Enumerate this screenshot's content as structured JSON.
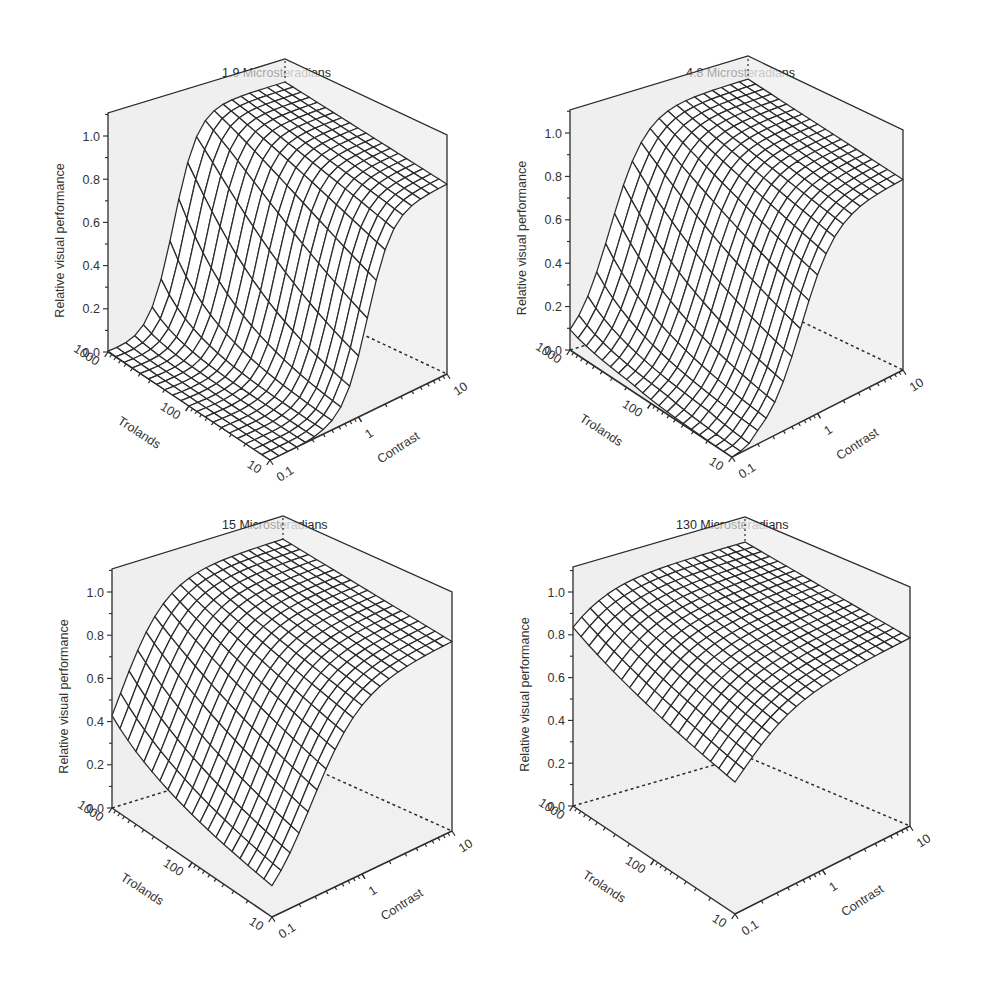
{
  "figure": {
    "background": "#ffffff",
    "wall_shade": "#e6e6e6",
    "line_color": "#2b2b2b"
  },
  "chart_data": [
    {
      "type": "surface3d",
      "title": "1.9 Microsteradians",
      "xlabel": "Trolands",
      "ylabel": "Contrast",
      "zlabel": "Relative visual performance",
      "x_ticks": [
        "1000",
        "100",
        "10"
      ],
      "x_range_log": [
        10,
        1000
      ],
      "y_ticks": [
        "0.1",
        "1",
        "10"
      ],
      "y_range_log": [
        0.1,
        10
      ],
      "z_ticks": [
        "0.0",
        "0.2",
        "0.4",
        "0.6",
        "0.8",
        "1.0"
      ],
      "zlim": [
        0,
        1.1
      ],
      "grid_lines": 20,
      "params": {
        "c_half": 0.55,
        "c_steep": 3.2,
        "t_effect": 0.1,
        "cmin": 0.18,
        "floor_z": 0.0,
        "peak": 1.0
      },
      "description": "RVP ~0 at low contrast (<0.2) for all retinal illuminances; rises steeply to a plateau ~0.95–1.0 at contrast ≥1; plateau slightly lower (~0.85) at 10 trolands"
    },
    {
      "type": "surface3d",
      "title": "4.8 Microsteradians",
      "xlabel": "Trolands",
      "ylabel": "Contrast",
      "zlabel": "Relative visual performance",
      "x_ticks": [
        "1000",
        "100",
        "10"
      ],
      "x_range_log": [
        10,
        1000
      ],
      "y_ticks": [
        "0.1",
        "1",
        "10"
      ],
      "y_range_log": [
        0.1,
        10
      ],
      "z_ticks": [
        "0.0",
        "0.2",
        "0.4",
        "0.6",
        "0.8",
        "1.0"
      ],
      "zlim": [
        0,
        1.1
      ],
      "grid_lines": 20,
      "params": {
        "c_half": 0.28,
        "c_steep": 2.2,
        "t_effect": 0.55,
        "cmin": 0.1,
        "floor_z": 0.0,
        "peak": 1.0
      },
      "description": "At 1000 trolands, contrast 0.1 gives RVP ~0.55; at 10 trolands, contrast 0.1 gives ~0; plateau ~0.9–1.0 at high contrast"
    },
    {
      "type": "surface3d",
      "title": "15 Microsteradians",
      "xlabel": "Trolands",
      "ylabel": "Contrast",
      "zlabel": "Relative visual performance",
      "x_ticks": [
        "1000",
        "100",
        "10"
      ],
      "x_range_log": [
        10,
        1000
      ],
      "y_ticks": [
        "0.1",
        "1",
        "10"
      ],
      "y_range_log": [
        0.1,
        10
      ],
      "z_ticks": [
        "0.0",
        "0.2",
        "0.4",
        "0.6",
        "0.8",
        "1.0"
      ],
      "zlim": [
        0,
        1.1
      ],
      "grid_lines": 20,
      "params": {
        "c_half": 0.12,
        "c_steep": 1.6,
        "t_effect": 0.85,
        "cmin": 0.05,
        "floor_z": 0.0,
        "peak": 1.0
      },
      "description": "At 1000 trolands, contrast 0.1 gives RVP ~0.8; sharp dip to ~0 at 10 trolands and contrast 0.1; plateau ~0.9–1.0"
    },
    {
      "type": "surface3d",
      "title": "130 Microsteradians",
      "xlabel": "Trolands",
      "ylabel": "Contrast",
      "zlabel": "Relative visual performance",
      "x_ticks": [
        "1000",
        "100",
        "10"
      ],
      "x_range_log": [
        10,
        1000
      ],
      "y_ticks": [
        "0.1",
        "1",
        "10"
      ],
      "y_range_log": [
        0.1,
        10
      ],
      "z_ticks": [
        "0.0",
        "0.2",
        "0.4",
        "0.6",
        "0.8",
        "1.0"
      ],
      "zlim": [
        0,
        1.1
      ],
      "grid_lines": 20,
      "params": {
        "c_half": 0.05,
        "c_steep": 1.4,
        "t_effect": 0.9,
        "cmin": 0.02,
        "floor_z": 0.4,
        "peak": 1.0
      },
      "description": "Surface stays high everywhere: ~0.92 at 1000 trolands/contrast 0.1, minimum ~0.42 at 10 trolands/contrast 0.1; plateau ~0.95–1.0"
    }
  ],
  "panels": [
    {
      "title": "1.9 Microsteradians"
    },
    {
      "title": "4.8 Microsteradians"
    },
    {
      "title": "15 Microsteradians"
    },
    {
      "title": "130 Microsteradians"
    }
  ]
}
